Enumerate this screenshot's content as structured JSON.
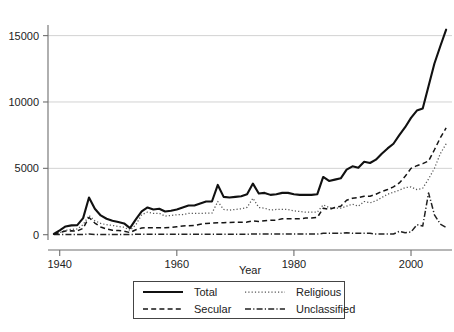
{
  "chart_data": {
    "type": "line",
    "title": "",
    "xlabel": "Year",
    "ylabel": "",
    "xlim": [
      1938,
      2007
    ],
    "ylim": [
      -400,
      15800
    ],
    "grid": "horizontal",
    "legend_position": "bottom-center",
    "xticks": [
      1940,
      1960,
      1980,
      2000
    ],
    "xtick_labels": [
      "1940",
      "1960",
      "1980",
      "2000"
    ],
    "yticks": [
      0,
      5000,
      10000,
      15000
    ],
    "ytick_labels": [
      "0",
      "5000",
      "10000",
      "15000"
    ],
    "x": [
      1939,
      1940,
      1941,
      1942,
      1943,
      1944,
      1945,
      1946,
      1947,
      1948,
      1949,
      1950,
      1951,
      1952,
      1953,
      1954,
      1955,
      1956,
      1957,
      1958,
      1959,
      1960,
      1961,
      1962,
      1963,
      1964,
      1965,
      1966,
      1967,
      1968,
      1969,
      1970,
      1971,
      1972,
      1973,
      1974,
      1975,
      1976,
      1977,
      1978,
      1979,
      1980,
      1981,
      1982,
      1983,
      1984,
      1985,
      1986,
      1987,
      1988,
      1989,
      1990,
      1991,
      1992,
      1993,
      1994,
      1995,
      1996,
      1997,
      1998,
      1999,
      2000,
      2001,
      2002,
      2003,
      2004,
      2005,
      2006
    ],
    "series": [
      {
        "name": "Total",
        "style": "solid",
        "color": "#111111",
        "values": [
          60,
          330,
          620,
          700,
          720,
          1250,
          2800,
          1950,
          1450,
          1200,
          1050,
          950,
          850,
          500,
          1150,
          1750,
          2050,
          1900,
          1950,
          1750,
          1800,
          1900,
          2050,
          2200,
          2200,
          2350,
          2500,
          2500,
          3750,
          2850,
          2800,
          2850,
          2900,
          3050,
          3850,
          3100,
          3150,
          3000,
          3050,
          3150,
          3150,
          3050,
          3000,
          3000,
          3000,
          3050,
          4350,
          4050,
          4150,
          4250,
          4900,
          5150,
          5050,
          5500,
          5400,
          5650,
          6100,
          6500,
          6850,
          7500,
          8100,
          8800,
          9350,
          9500,
          11200,
          12900,
          14200,
          15450
        ]
      },
      {
        "name": "Religious",
        "style": "dotted",
        "color": "#555555",
        "values": [
          20,
          150,
          330,
          400,
          430,
          750,
          1450,
          1050,
          850,
          750,
          700,
          620,
          560,
          330,
          750,
          1500,
          1700,
          1600,
          1620,
          1400,
          1450,
          1500,
          1520,
          1600,
          1600,
          1600,
          1620,
          1620,
          2500,
          1900,
          1850,
          1900,
          1950,
          2050,
          2750,
          2050,
          2000,
          1850,
          1900,
          1900,
          1900,
          1800,
          1750,
          1700,
          1700,
          1700,
          2250,
          2050,
          2000,
          2000,
          2150,
          2300,
          2150,
          2500,
          2400,
          2550,
          2800,
          3050,
          3200,
          3350,
          3550,
          3600,
          3400,
          3500,
          4200,
          5000,
          6100,
          6850
        ]
      },
      {
        "name": "Secular",
        "style": "dashed",
        "color": "#151515",
        "values": [
          30,
          170,
          280,
          290,
          280,
          480,
          1300,
          880,
          580,
          430,
          330,
          310,
          270,
          160,
          370,
          500,
          530,
          520,
          530,
          520,
          550,
          600,
          650,
          680,
          700,
          780,
          850,
          870,
          900,
          900,
          920,
          930,
          930,
          950,
          1050,
          1000,
          1050,
          1080,
          1100,
          1200,
          1200,
          1200,
          1200,
          1250,
          1250,
          1300,
          2000,
          1900,
          2050,
          2150,
          2600,
          2750,
          2800,
          2900,
          2900,
          3050,
          3250,
          3400,
          3600,
          3900,
          4400,
          5000,
          5200,
          5350,
          5550,
          6400,
          7300,
          8050
        ]
      },
      {
        "name": "Unclassified",
        "style": "dash-dot",
        "color": "#222222",
        "values": [
          10,
          10,
          10,
          10,
          10,
          20,
          50,
          20,
          20,
          20,
          20,
          20,
          20,
          10,
          30,
          30,
          30,
          30,
          30,
          30,
          30,
          30,
          30,
          30,
          30,
          30,
          30,
          30,
          30,
          30,
          30,
          30,
          30,
          30,
          50,
          50,
          50,
          50,
          50,
          50,
          50,
          50,
          50,
          50,
          50,
          50,
          100,
          100,
          100,
          100,
          150,
          100,
          100,
          100,
          100,
          50,
          50,
          50,
          50,
          250,
          150,
          200,
          750,
          650,
          3150,
          1500,
          800,
          550
        ]
      }
    ]
  },
  "legend": {
    "entries": [
      {
        "label": "Total",
        "key": "total-line-key"
      },
      {
        "label": "Religious",
        "key": "religious-line-key"
      },
      {
        "label": "Secular",
        "key": "secular-line-key"
      },
      {
        "label": "Unclassified",
        "key": "unclassified-line-key"
      }
    ]
  }
}
